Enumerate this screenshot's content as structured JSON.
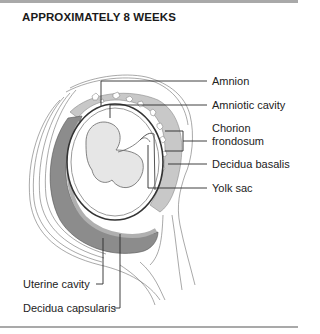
{
  "figure": {
    "title": "APPROXIMATELY 8 WEEKS",
    "labels_right": [
      {
        "id": "amnion",
        "text": "Amnion"
      },
      {
        "id": "amniotic-cavity",
        "text": "Amniotic cavity"
      },
      {
        "id": "chorion-frondosum",
        "line1": "Chorion",
        "line2": "frondosum"
      },
      {
        "id": "decidua-basalis",
        "text": "Decidua basalis"
      },
      {
        "id": "yolk-sac",
        "text": "Yolk sac"
      }
    ],
    "labels_left": [
      {
        "id": "uterine-cavity",
        "text": "Uterine cavity"
      },
      {
        "id": "decidua-capsularis",
        "text": "Decidua capsularis"
      }
    ],
    "colors": {
      "frame": "#a9a9a9",
      "decidua_dark": "#8c8c8c",
      "chorion_speckle": "#bdbdbd",
      "line": "#2a2a2a"
    }
  }
}
